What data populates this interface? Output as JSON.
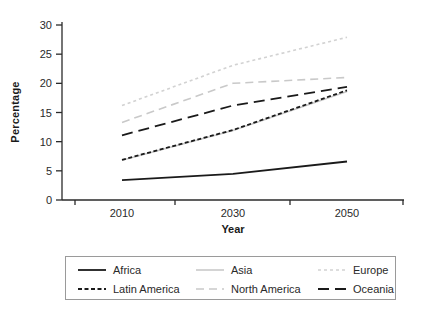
{
  "chart_data": {
    "type": "line",
    "title": "",
    "xlabel": "Year",
    "ylabel": "Percentage",
    "categories": [
      "2010",
      "2030",
      "2050"
    ],
    "ylim": [
      0,
      30
    ],
    "ytick_step": 5,
    "grid": false,
    "legend_position": "bottom-box",
    "axis_color": "#2a2a2a",
    "series": [
      {
        "name": "Africa",
        "values": [
          3.4,
          4.5,
          6.6
        ],
        "color": "#1a1a1a",
        "dash": "solid"
      },
      {
        "name": "Asia",
        "values": [
          6.8,
          11.9,
          18.6
        ],
        "color": "#c9c9c9",
        "dash": "solid"
      },
      {
        "name": "Europe",
        "values": [
          16.2,
          23.1,
          27.9
        ],
        "color": "#d2d2d2",
        "dash": "dotted"
      },
      {
        "name": "Latin America",
        "values": [
          6.9,
          12.0,
          18.8
        ],
        "color": "#1a1a1a",
        "dash": "short-dash"
      },
      {
        "name": "North America",
        "values": [
          13.3,
          20.0,
          21.0
        ],
        "color": "#c9c9c9",
        "dash": "dash"
      },
      {
        "name": "Oceania",
        "values": [
          11.1,
          16.2,
          19.4
        ],
        "color": "#1a1a1a",
        "dash": "long-dash"
      }
    ]
  }
}
